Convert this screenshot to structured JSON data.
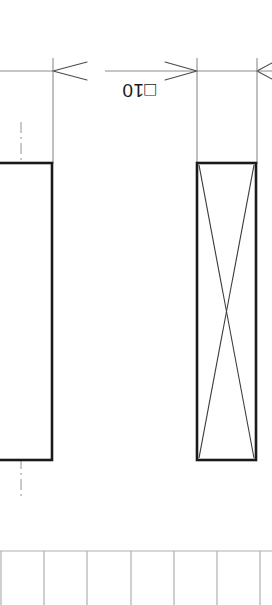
{
  "drawing": {
    "title": "Mechanical part detail view",
    "background_color": "#ffffff",
    "canvas": {
      "width": 272,
      "height": 605
    },
    "line_colors": {
      "object_line": "#1a1a1a",
      "thin_line": "#8c8c8c",
      "center_line": "#a6a6a6",
      "grid_line": "#b0b0b0",
      "text": "#1a1a1a"
    },
    "dimension": {
      "label": "□10",
      "value": "10",
      "symbol": "□",
      "symbol_name": "square-section-symbol",
      "rotation_degrees": 180,
      "text_x": 139,
      "text_y": 98,
      "dimension_line_y": 71,
      "arrows": [
        {
          "name": "arrow-left-at-53",
          "x": 53,
          "direction": "left"
        },
        {
          "name": "arrow-right-at-197",
          "x": 197,
          "direction": "right"
        },
        {
          "name": "arrow-left-at-257",
          "x": 257,
          "direction": "left"
        }
      ],
      "dimension_line_segments": [
        {
          "x1": 0,
          "x2": 53
        },
        {
          "x1": 105,
          "x2": 197
        },
        {
          "x1": 197,
          "x2": 272
        }
      ],
      "extension_lines": [
        {
          "name": "extension-line-left",
          "x": 53,
          "y1": 58,
          "y2": 164
        },
        {
          "name": "extension-line-mid",
          "x": 197,
          "y1": 58,
          "y2": 164
        },
        {
          "name": "extension-line-right",
          "x": 257,
          "y1": 58,
          "y2": 164
        }
      ]
    },
    "shapes": [
      {
        "name": "left-rectangle",
        "type": "rect",
        "x": -40,
        "y": 163,
        "width": 92,
        "height": 297,
        "stroke_width": 2.6,
        "has_diagonals": false
      },
      {
        "name": "right-rectangle",
        "type": "rect",
        "x": 197,
        "y": 163,
        "width": 59,
        "height": 297,
        "stroke_width": 2.6,
        "has_diagonals": true
      }
    ],
    "center_line": {
      "name": "vertical-center-line",
      "x": 21,
      "y1": 122,
      "y2": 497,
      "style": "dash-dot"
    },
    "grid": {
      "name": "bottom-grid",
      "top_y": 551,
      "bottom_y": 605,
      "columns": [
        0,
        44,
        87,
        131,
        174,
        217,
        260
      ],
      "horizontal_lines": [
        551
      ]
    }
  }
}
